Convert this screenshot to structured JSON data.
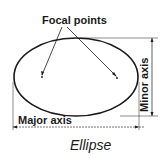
{
  "diagram": {
    "title": "Ellipse",
    "labels": {
      "focal_points": "Focal points",
      "minor_axis": "Minor axis",
      "major_axis": "Major axis"
    },
    "colors": {
      "stroke": "#1a1a1a",
      "background": "#ffffff"
    }
  }
}
